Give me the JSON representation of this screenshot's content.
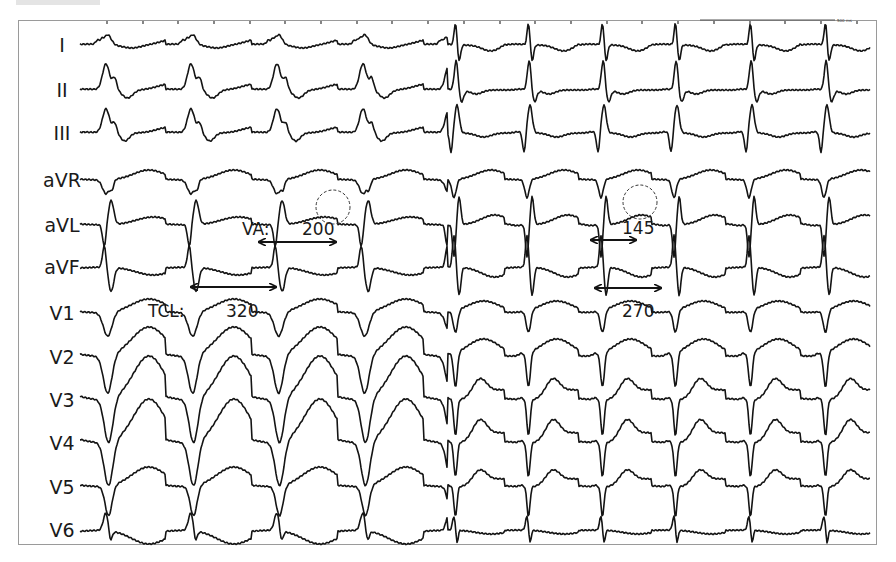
{
  "figure": {
    "scale_bar_label": "500 ms",
    "colors": {
      "trace": "#141414",
      "frame": "#9a9a9a",
      "background": "#ffffff"
    }
  },
  "leads": [
    {
      "name": "I",
      "y": 45,
      "morph": "lI"
    },
    {
      "name": "II",
      "y": 90,
      "morph": "lII"
    },
    {
      "name": "III",
      "y": 133,
      "morph": "lIII"
    },
    {
      "name": "aVR",
      "y": 180,
      "morph": "aVR"
    },
    {
      "name": "aVL",
      "y": 225,
      "morph": "aVL"
    },
    {
      "name": "aVF",
      "y": 267,
      "morph": "aVF"
    },
    {
      "name": "V1",
      "y": 313,
      "morph": "V1"
    },
    {
      "name": "V2",
      "y": 357,
      "morph": "V2"
    },
    {
      "name": "V3",
      "y": 400,
      "morph": "V3"
    },
    {
      "name": "V4",
      "y": 443,
      "morph": "V4"
    },
    {
      "name": "V5",
      "y": 487,
      "morph": "V5"
    },
    {
      "name": "V6",
      "y": 530,
      "morph": "V6"
    }
  ],
  "annotations": {
    "tcl_label": "TCL:",
    "tcl_left": "320",
    "tcl_right": "270",
    "va_label": "VA:",
    "va_left": "200",
    "va_right": "145"
  },
  "chart_data": {
    "type": "line",
    "xlabel": "",
    "ylabel": "",
    "grid": false,
    "legend_position": "none",
    "lead_labels": [
      "I",
      "II",
      "III",
      "aVR",
      "aVL",
      "aVF",
      "V1",
      "V2",
      "V3",
      "V4",
      "V5",
      "V6"
    ],
    "segments": [
      {
        "name": "left segment",
        "tcl_ms": 320,
        "va_ms": 200,
        "beat_x_px": [
          112,
          197,
          283,
          369
        ]
      },
      {
        "name": "right segment",
        "tcl_ms": 270,
        "va_ms": 145,
        "beat_x_px": [
          460,
          533,
          607,
          680,
          755,
          830
        ]
      }
    ],
    "annotations": [
      {
        "text": "TCL: 320",
        "type": "double-arrow",
        "x_px": [
          190,
          277
        ],
        "y_px": 287
      },
      {
        "text": "VA: 200",
        "type": "double-arrow",
        "x_px": [
          258,
          337
        ],
        "y_px": 242
      },
      {
        "text": "145",
        "type": "double-arrow",
        "x_px": [
          590,
          637
        ],
        "y_px": 240
      },
      {
        "text": "270",
        "type": "double-arrow",
        "x_px": [
          594,
          662
        ],
        "y_px": 288
      },
      {
        "type": "dashed-circle",
        "center_px": [
          333,
          207
        ],
        "r_px": 17,
        "lead": "aVL"
      },
      {
        "type": "dashed-circle",
        "center_px": [
          640,
          202
        ],
        "r_px": 17,
        "lead": "aVL"
      }
    ],
    "time_ticks_px": [
      107,
      143,
      178,
      214,
      250,
      285,
      321,
      357,
      392,
      428,
      464,
      500,
      535,
      571,
      607,
      642,
      678,
      714,
      750,
      785,
      821,
      857
    ],
    "scale_bar": {
      "label": "500 ms",
      "x_px": [
        700,
        835
      ],
      "y_px": 20
    }
  }
}
